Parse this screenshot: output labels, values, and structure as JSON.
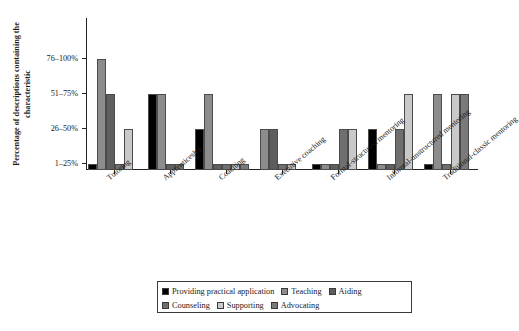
{
  "chart_data": {
    "type": "bar",
    "title": "",
    "xlabel": "",
    "ylabel": "Percentage of descriptions containing the characteristic",
    "grid": false,
    "legend_position": "bottom",
    "ylim": [
      0,
      4
    ],
    "ytick_labels": [
      "1–25%",
      "26–50%",
      "51–75%",
      "76–100%"
    ],
    "ytick_values": [
      1,
      2,
      3,
      4
    ],
    "categories": [
      "Tutoring",
      "Apprenticeship",
      "Coaching",
      "Executive coaching",
      "Formal-structured mentoring",
      "Informal-unstructured mentoring",
      "Traditional-classic mentoring"
    ],
    "series": [
      {
        "name": "Providing practical application",
        "color": "#000000",
        "values": [
          1,
          3,
          2,
          0,
          1,
          2,
          1
        ]
      },
      {
        "name": "Teaching",
        "color": "#8c8c8c",
        "values": [
          4,
          3,
          3,
          2,
          1,
          1,
          3
        ]
      },
      {
        "name": "Aiding",
        "color": "#5e5e5e",
        "values": [
          3,
          1,
          1,
          2,
          1,
          1,
          0
        ]
      },
      {
        "name": "Counseling",
        "color": "#6f6f6f",
        "values": [
          1,
          1,
          1,
          1,
          2,
          2,
          1
        ]
      },
      {
        "name": "Supporting",
        "color": "#c9c9c9",
        "values": [
          2,
          0,
          1,
          1,
          2,
          3,
          3
        ]
      },
      {
        "name": "Advocating",
        "color": "#7a7a7a",
        "values": [
          0,
          0,
          1,
          0,
          0,
          0,
          3
        ]
      }
    ]
  },
  "legend": {
    "rows": [
      [
        {
          "label": "Providing practical application",
          "color": "#000000"
        },
        {
          "label": "Teaching",
          "color": "#8c8c8c"
        },
        {
          "label": "Aiding",
          "color": "#5e5e5e"
        }
      ],
      [
        {
          "label": "Counseling",
          "color": "#6f6f6f"
        },
        {
          "label": "Supporting",
          "color": "#c9c9c9"
        },
        {
          "label": "Advocating",
          "color": "#7a7a7a"
        }
      ]
    ]
  },
  "caption": {
    "text": ""
  }
}
